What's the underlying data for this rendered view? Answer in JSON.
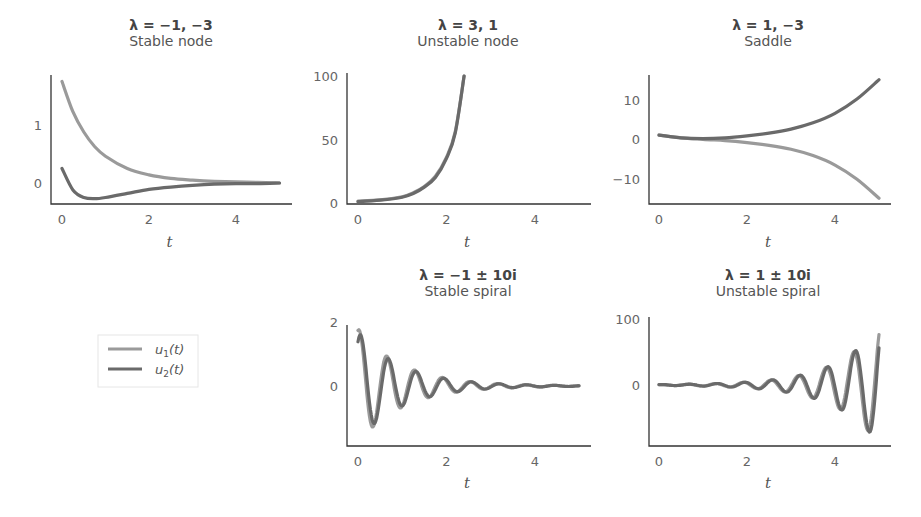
{
  "legend": {
    "entries": [
      {
        "label": "u1(t)",
        "base": "u",
        "sub": "1",
        "arg": "(t)",
        "color": "#9a9a9a"
      },
      {
        "label": "u2(t)",
        "base": "u",
        "sub": "2",
        "arg": "(t)",
        "color": "#6a6a6a"
      }
    ]
  },
  "colors": {
    "u1": "#9a9a9a",
    "u2": "#6a6a6a",
    "axis": "#333333"
  },
  "chart_data": [
    {
      "type": "line",
      "title": "λ =  −1,  −3",
      "subtitle": "Stable node",
      "xlabel": "t",
      "ylabel": "",
      "xlim": [
        0,
        5
      ],
      "ylim": [
        -0.4,
        1.85
      ],
      "xticks": [
        0,
        2,
        4
      ],
      "yticks": [
        0,
        1
      ],
      "series": [
        {
          "name": "u1(t)",
          "x": [
            0,
            0.25,
            0.5,
            0.75,
            1,
            1.5,
            2,
            2.5,
            3,
            3.5,
            4,
            4.5,
            5
          ],
          "values": [
            1.75,
            1.23,
            0.88,
            0.63,
            0.46,
            0.25,
            0.14,
            0.08,
            0.05,
            0.03,
            0.02,
            0.01,
            0.0
          ]
        },
        {
          "name": "u2(t)",
          "x": [
            0,
            0.25,
            0.5,
            0.75,
            1,
            1.5,
            2,
            2.5,
            3,
            3.5,
            4,
            4.5,
            5
          ],
          "values": [
            0.25,
            -0.12,
            -0.25,
            -0.27,
            -0.25,
            -0.18,
            -0.11,
            -0.07,
            -0.04,
            -0.02,
            -0.01,
            -0.01,
            0.0
          ]
        }
      ],
      "grid": false
    },
    {
      "type": "line",
      "title": "λ =  3, 1",
      "subtitle": "Unstable node",
      "xlabel": "t",
      "ylabel": "",
      "xlim": [
        0,
        5
      ],
      "ylim": [
        0,
        100
      ],
      "xticks": [
        0,
        2,
        4
      ],
      "yticks": [
        0,
        50,
        100
      ],
      "series": [
        {
          "name": "u1(t)",
          "x": [
            0,
            0.5,
            1,
            1.25,
            1.5,
            1.75,
            2,
            2.2,
            2.4
          ],
          "values": [
            1.5,
            2.5,
            5,
            8,
            13,
            21,
            36,
            56,
            100
          ]
        },
        {
          "name": "u2(t)",
          "x": [
            0,
            0.5,
            1,
            1.25,
            1.5,
            1.75,
            2,
            2.2,
            2.4
          ],
          "values": [
            1.0,
            2.2,
            4.6,
            7.5,
            12.5,
            20,
            35,
            55,
            100
          ]
        }
      ],
      "grid": false
    },
    {
      "type": "line",
      "title": "λ =  1,  −3",
      "subtitle": "Saddle",
      "xlabel": "t",
      "ylabel": "",
      "xlim": [
        0,
        5
      ],
      "ylim": [
        -16,
        16
      ],
      "xticks": [
        0,
        2,
        4
      ],
      "yticks": [
        -10,
        0,
        10
      ],
      "series": [
        {
          "name": "u1(t)",
          "x": [
            0,
            0.5,
            1,
            1.5,
            2,
            2.5,
            3,
            3.5,
            4,
            4.5,
            5
          ],
          "values": [
            1.0,
            0.3,
            -0.1,
            -0.4,
            -0.9,
            -1.6,
            -2.6,
            -4.2,
            -6.6,
            -10.2,
            -15.0
          ]
        },
        {
          "name": "u2(t)",
          "x": [
            0,
            0.5,
            1,
            1.5,
            2,
            2.5,
            3,
            3.5,
            4,
            4.5,
            5
          ],
          "values": [
            1.0,
            0.3,
            0.1,
            0.3,
            0.8,
            1.5,
            2.5,
            4.1,
            6.5,
            10.1,
            15.0
          ]
        }
      ],
      "grid": false
    },
    {
      "type": "line",
      "title": "λ =  −1 ± 10i",
      "subtitle": "Stable spiral",
      "xlabel": "t",
      "ylabel": "",
      "xlim": [
        0,
        5
      ],
      "ylim": [
        -1.9,
        2.0
      ],
      "xticks": [
        0,
        2,
        4
      ],
      "yticks": [
        0,
        2
      ],
      "model": {
        "decay": -1,
        "omega": 10,
        "u1_amp": 1.8,
        "u1_phase": 1.3,
        "u2_amp": 1.7,
        "u2_phase": 0.95
      },
      "series": [
        {
          "name": "u1(t)",
          "description": "damped oscillation starting ~1.6, peak ~1.8, decaying to 0"
        },
        {
          "name": "u2(t)",
          "description": "damped oscillation starting ~1.25, min ~-1.6, decaying to 0"
        }
      ],
      "grid": false
    },
    {
      "type": "line",
      "title": "λ = 1 ± 10i",
      "subtitle": "Unstable spiral",
      "xlabel": "t",
      "ylabel": "",
      "xlim": [
        0,
        5
      ],
      "ylim": [
        -95,
        100
      ],
      "xticks": [
        0,
        2,
        4
      ],
      "yticks": [
        0,
        100
      ],
      "model": {
        "growth": 1,
        "omega": 10,
        "u1_amp": 0.6,
        "u1_phase": 1.3,
        "u2_amp": 0.6,
        "u2_phase": 0.95
      },
      "series": [
        {
          "name": "u1(t)",
          "description": "growing oscillation from ~0, peak ~90 near t=5"
        },
        {
          "name": "u2(t)",
          "description": "growing oscillation from ~0, min ~-85 near t=4.8"
        }
      ],
      "grid": false
    }
  ]
}
